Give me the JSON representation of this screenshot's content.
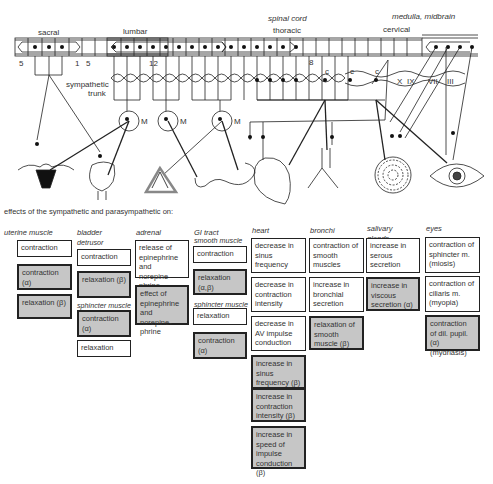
{
  "diagram": {
    "labels": {
      "spinal_cord": "spinal cord",
      "medulla": "medulla, midbrain",
      "sacral": "sacral",
      "lumbar": "lumbar",
      "thoracic": "thoracic",
      "cervical": "cervical",
      "sympathetic_trunk_1": "sympathetic",
      "sympathetic_trunk_2": "trunk",
      "seg_5a": "5",
      "seg_1": "1",
      "seg_5b": "5",
      "seg_12": "12",
      "seg_8": "8",
      "ganglion_c1": "c",
      "ganglion_c2": "c",
      "ganglion_c3": "c",
      "ganglion_m1": "M",
      "ganglion_m2": "M",
      "ganglion_m3": "M",
      "nerve_x": "X",
      "nerve_ix": "IX",
      "nerve_vii": "VII",
      "nerve_iii": "III"
    },
    "organs": [
      "uterus",
      "bladder",
      "adrenal",
      "gi-tract",
      "heart",
      "bronchi",
      "salivary-gland",
      "eye"
    ]
  },
  "effects": {
    "title": "effects of the sympathetic and parasympathetic on:",
    "columns": [
      {
        "header": "uterine muscle",
        "groups": [
          {
            "subheading": "",
            "boxes": [
              {
                "text": "contraction",
                "shaded": false
              },
              {
                "text": "contraction (α)",
                "shaded": true
              },
              {
                "text": "relaxation (β)",
                "shaded": true
              }
            ]
          }
        ]
      },
      {
        "header": "bladder",
        "groups": [
          {
            "subheading": "detrusor",
            "boxes": [
              {
                "text": "contraction",
                "shaded": false
              },
              {
                "text": "relaxation (β)",
                "shaded": true
              }
            ]
          },
          {
            "subheading": "sphincter muscle",
            "boxes": [
              {
                "text": "contraction (α)",
                "shaded": true
              },
              {
                "text": "relaxation",
                "shaded": false
              }
            ]
          }
        ]
      },
      {
        "header": "adrenal medulla",
        "groups": [
          {
            "subheading": "",
            "boxes": [
              {
                "text": "release of epinephrine and norepine-phrine",
                "shaded": false
              },
              {
                "text": "effect of epinephrine and norepine-phrine",
                "shaded": true
              }
            ]
          }
        ]
      },
      {
        "header": "GI tract",
        "groups": [
          {
            "subheading": "smooth muscle",
            "boxes": [
              {
                "text": "contraction",
                "shaded": false
              },
              {
                "text": "relaxation (α,β)",
                "shaded": true
              }
            ]
          },
          {
            "subheading": "sphincter muscle",
            "boxes": [
              {
                "text": "relaxation",
                "shaded": false
              },
              {
                "text": "contraction (α)",
                "shaded": true
              }
            ]
          }
        ]
      },
      {
        "header": "heart",
        "groups": [
          {
            "subheading": "",
            "boxes": [
              {
                "text": "decrease in sinus frequency",
                "shaded": false
              },
              {
                "text": "decrease in contraction intensity",
                "shaded": false
              },
              {
                "text": "decrease in AV impulse conduction",
                "shaded": false
              },
              {
                "text": "increase in sinus frequency (β)",
                "shaded": true
              },
              {
                "text": "increase in contraction intensity (β)",
                "shaded": true
              },
              {
                "text": "increase in speed of impulse conduction (β)",
                "shaded": true
              }
            ]
          }
        ]
      },
      {
        "header": "bronchi",
        "groups": [
          {
            "subheading": "",
            "boxes": [
              {
                "text": "contraction of smooth muscles",
                "shaded": false
              },
              {
                "text": "increase in bronchial secretion",
                "shaded": false
              },
              {
                "text": "relaxation of smooth muscle (β)",
                "shaded": true
              }
            ]
          }
        ]
      },
      {
        "header": "salivary glands",
        "groups": [
          {
            "subheading": "",
            "boxes": [
              {
                "text": "increase in serous secretion",
                "shaded": false
              },
              {
                "text": "increase in viscous secretion (α)",
                "shaded": true
              }
            ]
          }
        ]
      },
      {
        "header": "eyes",
        "groups": [
          {
            "subheading": "",
            "boxes": [
              {
                "text": "contraction of  sphincter m. (miosis)",
                "shaded": false
              },
              {
                "text": "contraction of  ciliaris m. (myopia)",
                "shaded": false
              },
              {
                "text": "contraction of dil. pupil. (α) (mydriasis)",
                "shaded": true
              }
            ]
          }
        ]
      }
    ]
  }
}
